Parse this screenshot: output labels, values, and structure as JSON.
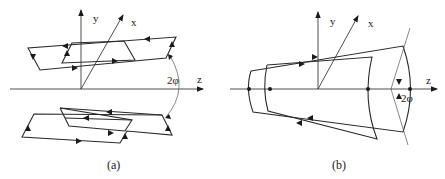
{
  "figure": {
    "panel_a": {
      "caption": "(a)",
      "axis_labels": {
        "y": "y",
        "x": "x",
        "z": "z"
      },
      "angle_label": "2φ",
      "description": "Two pairs of nested parallelogram current loops placed symmetrically above and below the z-axis, separated by angle 2φ"
    },
    "panel_b": {
      "caption": "(b)",
      "axis_labels": {
        "y": "y",
        "x": "x",
        "z": "z"
      },
      "angle_label": "2φ",
      "description": "Two nested saddle-shaped (curved trapezoid) loops around the z-axis with angular opening 2φ"
    },
    "colors": {
      "line": "#2a2a2a",
      "background": "#ffffff"
    }
  }
}
